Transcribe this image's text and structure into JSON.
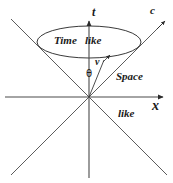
{
  "figure": {
    "stroke_color": "#3a3a3a",
    "text_color": "#1a1a1a",
    "background_color": "#ffffff",
    "origin": {
      "x": 89,
      "y": 97
    }
  },
  "axes": {
    "time_axis": {
      "label": "t",
      "orientation": "vertical",
      "arrow_at": "top",
      "x": 89,
      "y_top": 20,
      "y_bottom": 178
    },
    "space_axis": {
      "label": "x",
      "orientation": "horizontal",
      "arrow_at": "right",
      "y": 97,
      "x_left": 5,
      "x_right": 166
    }
  },
  "cone": {
    "speed_of_light_label": "c",
    "upper_right_line": {
      "x1": 89,
      "y1": 97,
      "x2": 163,
      "y2": 23
    },
    "upper_left_line": {
      "x1": 89,
      "y1": 97,
      "x2": 11,
      "y2": 19
    },
    "lower_right_line": {
      "x1": 89,
      "y1": 97,
      "x2": 167,
      "y2": 175
    },
    "lower_left_line": {
      "x1": 89,
      "y1": 97,
      "x2": 11,
      "y2": 175
    },
    "rim_ellipse": {
      "cx": 89,
      "cy": 42,
      "rx": 52,
      "ry": 16
    }
  },
  "vector": {
    "label": "v",
    "accent": "arrow",
    "angle_label": "θ",
    "line": {
      "x1": 89,
      "y1": 97,
      "x2": 105,
      "y2": 58
    }
  },
  "regions": {
    "timelike": {
      "word_one": "Time",
      "word_two": "like"
    },
    "spacelike": {
      "word_one": "Space",
      "word_two": "like"
    }
  }
}
